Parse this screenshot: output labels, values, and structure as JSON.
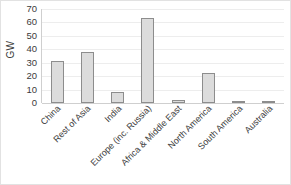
{
  "chart_data": {
    "type": "bar",
    "title": "",
    "xlabel": "",
    "ylabel": "GW",
    "ylim": [
      0,
      70
    ],
    "yticks": [
      0,
      10,
      20,
      30,
      40,
      50,
      60,
      70
    ],
    "grid": true,
    "legend": false,
    "categories": [
      "China",
      "Rest of Asia",
      "India",
      "Europe (inc. Russia)",
      "Africa & Middle East",
      "North America",
      "South America",
      "Australia"
    ],
    "values": [
      31,
      38,
      8,
      63,
      2,
      22,
      1,
      1
    ],
    "bar_fill": "#dcdcdc",
    "bar_stroke": "#8d8d8d",
    "gridline_color": "#ededed",
    "axis_color": "#cfcfcf",
    "text_color": "#3b3b3b"
  }
}
